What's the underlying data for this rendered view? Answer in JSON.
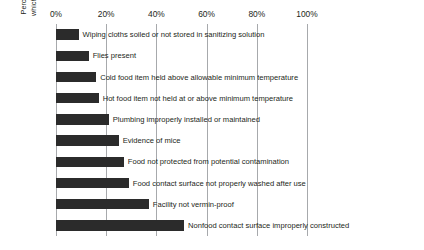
{
  "chart_data": {
    "type": "bar",
    "orientation": "horizontal",
    "title": "",
    "xlabel": "",
    "ylabel": "Percentage of businesses in which the violation was found",
    "ylabel_lines": [
      "Percentage of businesses in",
      "which the violation was found"
    ],
    "xlim": [
      0,
      110
    ],
    "xticks": [
      0,
      20,
      40,
      60,
      80,
      100
    ],
    "xtick_labels": [
      "0%",
      "20%",
      "40%",
      "60%",
      "80%",
      "100%"
    ],
    "xaxis_position": "top",
    "grid": "vertical",
    "legend": "none",
    "bar_color": "#2b2b2b",
    "gridline_color": "#a7a9ac",
    "categories": [
      "Wiping cloths soiled or not stored in sanitizing solution",
      "Flies present",
      "Cold food item held above allowable minimum temperature",
      "Hot food item not held at or above minimum temperature",
      "Plumbing improperly installed or maintained",
      "Evidence of mice",
      "Food not protected from potential contamination",
      "Food contact surface not properly washed after use",
      "Facility not vermin-proof",
      "Nonfood contact surface improperly constructed"
    ],
    "values": [
      9,
      13,
      16,
      17,
      21,
      25,
      27,
      29,
      37,
      51
    ]
  }
}
